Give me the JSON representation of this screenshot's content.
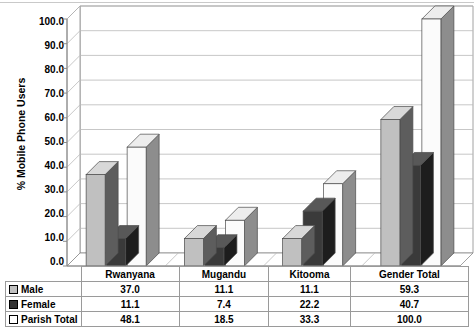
{
  "chart_data": {
    "type": "bar",
    "title": "",
    "subtitle": "",
    "xlabel": "",
    "ylabel": "% Mobile Phone Users",
    "ylim": [
      0.0,
      100.0
    ],
    "ytick_step": 10.0,
    "ytick_labels": [
      "0.0",
      "10.0",
      "20.0",
      "30.0",
      "40.0",
      "50.0",
      "60.0",
      "70.0",
      "80.0",
      "90.0",
      "100.0"
    ],
    "grid": true,
    "legend_position": "table-row-headers",
    "three_d": true,
    "categories": [
      "Rwanyana",
      "Mugandu",
      "Kitooma",
      "Gender Total"
    ],
    "series": [
      {
        "name": "Male",
        "values": [
          37.0,
          11.1,
          11.1,
          59.3
        ],
        "color": "#c0c0c0",
        "swatch": "sw-male"
      },
      {
        "name": "Female",
        "values": [
          11.1,
          7.4,
          22.2,
          40.7
        ],
        "color": "#333333",
        "swatch": "sw-female"
      },
      {
        "name": "Parish Total",
        "values": [
          48.1,
          18.5,
          33.3,
          100.0
        ],
        "color": "#ffffff",
        "swatch": "sw-total"
      }
    ],
    "value_labels": {
      "Male": [
        "37.0",
        "11.1",
        "11.1",
        "59.3"
      ],
      "Female": [
        "11.1",
        "7.4",
        "22.2",
        "40.7"
      ],
      "Parish Total": [
        "48.1",
        "18.5",
        "33.3",
        "100.0"
      ]
    }
  },
  "data_table": {
    "corner_label": "",
    "column_headers": [
      "Rwanyana",
      "Mugandu",
      "Kitooma",
      "Gender Total"
    ],
    "rows": [
      {
        "label": "Male",
        "swatch": "sw-male",
        "cells": [
          "37.0",
          "11.1",
          "11.1",
          "59.3"
        ]
      },
      {
        "label": "Female",
        "swatch": "sw-female",
        "cells": [
          "11.1",
          "7.4",
          "22.2",
          "40.7"
        ]
      },
      {
        "label": "Parish Total",
        "swatch": "sw-total",
        "cells": [
          "48.1",
          "18.5",
          "33.3",
          "100.0"
        ]
      }
    ]
  },
  "colors": {
    "male_front": "#c0c0c0",
    "male_side": "#5d5d5d",
    "male_top": "#d8d8d8",
    "female_front": "#3a3a3a",
    "female_side": "#1d1d1d",
    "female_top": "#585858",
    "total_front": "#fbfbfb",
    "total_side": "#8d8d8d",
    "total_top": "#ededed",
    "grid": "#b9b9b9",
    "axis": "#8a8a8a",
    "table_border": "#9a9a9a"
  }
}
